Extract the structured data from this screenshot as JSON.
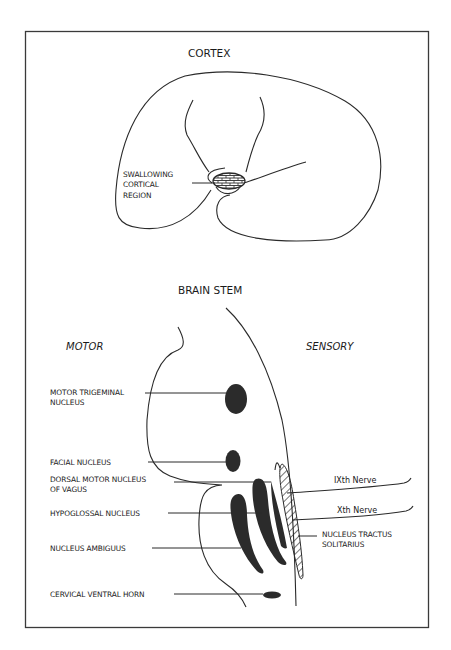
{
  "sections": {
    "cortex": {
      "title": "CORTEX",
      "region_label_lines": [
        "SWALLOWING",
        "CORTICAL",
        "REGION"
      ]
    },
    "brainstem": {
      "title": "BRAIN STEM",
      "left_heading": "MOTOR",
      "right_heading": "SENSORY",
      "motor_labels": {
        "motor_trigeminal": [
          "MOTOR TRIGEMINAL",
          "NUCLEUS"
        ],
        "facial": "FACIAL NUCLEUS",
        "dorsal_motor_vagus": [
          "DORSAL MOTOR NUCLEUS",
          "OF VAGUS"
        ],
        "hypoglossal": "HYPOGLOSSAL NUCLEUS",
        "ambiguus": "NUCLEUS AMBIGUUS",
        "cervical_ventral_horn": "CERVICAL VENTRAL HORN"
      },
      "sensory_labels": {
        "ninth_nerve": "IXth Nerve",
        "tenth_nerve": "Xth Nerve",
        "nts": [
          "NUCLEUS TRACTUS",
          "SOLITARIUS"
        ]
      }
    }
  },
  "colors": {
    "line": "#2a2a2a",
    "fill": "#2b2b2b",
    "background": "#ffffff"
  }
}
